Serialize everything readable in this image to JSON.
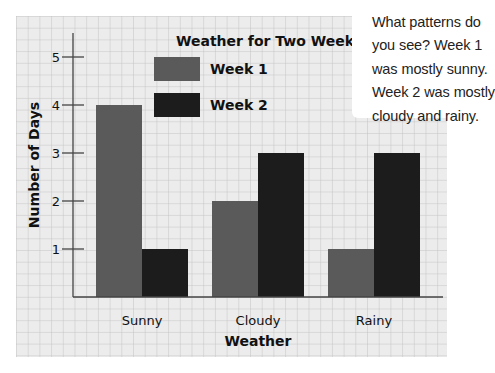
{
  "chart_data": {
    "type": "bar",
    "title": "Weather for Two Weeks",
    "xlabel": "Weather",
    "ylabel": "Number of Days",
    "categories": [
      "Sunny",
      "Cloudy",
      "Rainy"
    ],
    "series": [
      {
        "name": "Week 1",
        "values": [
          4,
          2,
          1
        ],
        "color": "#5a5a5a"
      },
      {
        "name": "Week 2",
        "values": [
          1,
          3,
          3
        ],
        "color": "#1c1c1c"
      }
    ],
    "ylim": [
      0,
      5
    ],
    "yticks": [
      1,
      2,
      3,
      4,
      5
    ],
    "grid": true,
    "legend_position": "top-center"
  },
  "colors": {
    "background": "#ffffff",
    "paper": "#ececec",
    "grid_line": "#c2c2c2",
    "axis": "#444444",
    "text": "#111111"
  },
  "callout": {
    "lines": [
      "What patterns do",
      "you see? Week 1",
      "was mostly sunny.",
      "Week 2 was mostly",
      "cloudy and rainy."
    ]
  }
}
